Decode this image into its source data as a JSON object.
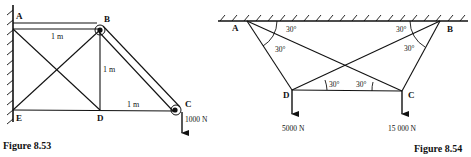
{
  "figure_53": {
    "caption": "Figure 8.53",
    "nodes": {
      "A": "A",
      "B": "B",
      "C": "C",
      "D": "D",
      "E": "E"
    },
    "dimensions": {
      "AB": "1 m",
      "BD": "1 m",
      "DC": "1 m"
    },
    "load": "1000 N"
  },
  "figure_54": {
    "caption": "Figure 8.54",
    "nodes": {
      "A": "A",
      "B": "B",
      "C": "C",
      "D": "D"
    },
    "angles": {
      "A_top": "30°",
      "A_inner": "30°",
      "B_top": "30°",
      "B_inner": "30°",
      "D": "30°",
      "C": "30°"
    },
    "loads": {
      "D": "5000 N",
      "C": "15 000 N"
    }
  },
  "colors": {
    "ink": "#111111",
    "background": "#ffffff"
  }
}
